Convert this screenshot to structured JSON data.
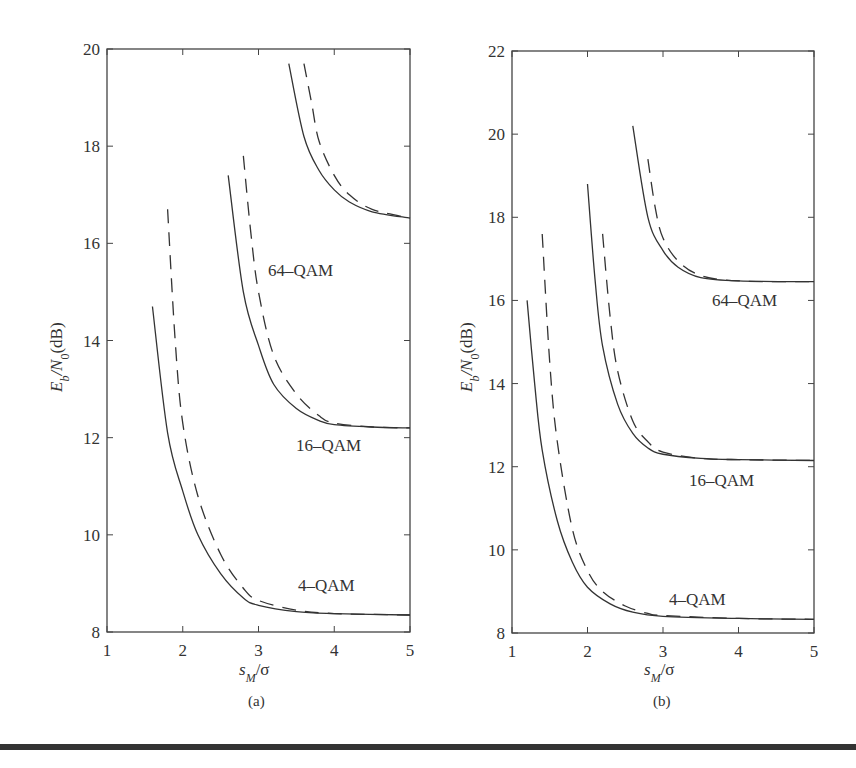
{
  "chart_data": [
    {
      "type": "line",
      "panel": "(a)",
      "xlabel": "s_M/σ",
      "ylabel": "E_b/N_0(dB)",
      "xlim": [
        1,
        5
      ],
      "ylim": [
        8,
        20
      ],
      "xticks": [
        1,
        2,
        3,
        4,
        5
      ],
      "yticks": [
        8,
        10,
        12,
        14,
        16,
        18,
        20
      ],
      "grid": false,
      "legend": "none (inline labels)",
      "annotations": [
        "64–QAM",
        "16–QAM",
        "4–QAM"
      ],
      "series": [
        {
          "name": "4-QAM solid",
          "style": "solid",
          "x": [
            1.6,
            1.8,
            2.0,
            2.2,
            2.5,
            2.8,
            3.0,
            3.5,
            4.0,
            5.0
          ],
          "y": [
            14.7,
            12.1,
            10.9,
            10.0,
            9.2,
            8.7,
            8.55,
            8.42,
            8.38,
            8.35
          ]
        },
        {
          "name": "4-QAM dashed",
          "style": "dashed",
          "x": [
            1.8,
            1.9,
            2.0,
            2.2,
            2.5,
            2.8,
            3.0,
            3.5,
            4.0,
            5.0
          ],
          "y": [
            16.7,
            14.0,
            12.3,
            10.8,
            9.6,
            8.9,
            8.65,
            8.45,
            8.38,
            8.35
          ]
        },
        {
          "name": "16-QAM solid",
          "style": "solid",
          "x": [
            2.6,
            2.8,
            3.0,
            3.2,
            3.5,
            3.8,
            4.0,
            4.5,
            5.0
          ],
          "y": [
            17.4,
            15.0,
            13.9,
            13.1,
            12.6,
            12.35,
            12.27,
            12.22,
            12.2
          ]
        },
        {
          "name": "16-QAM dashed",
          "style": "dashed",
          "x": [
            2.8,
            2.9,
            3.0,
            3.2,
            3.5,
            3.8,
            4.0,
            4.5,
            5.0
          ],
          "y": [
            17.8,
            16.2,
            15.0,
            13.7,
            12.9,
            12.45,
            12.3,
            12.22,
            12.2
          ]
        },
        {
          "name": "64-QAM solid",
          "style": "solid",
          "x": [
            3.4,
            3.6,
            3.8,
            4.0,
            4.2,
            4.5,
            5.0
          ],
          "y": [
            19.7,
            18.2,
            17.5,
            17.1,
            16.85,
            16.65,
            16.52
          ]
        },
        {
          "name": "64-QAM dashed",
          "style": "dashed",
          "x": [
            3.6,
            3.7,
            3.8,
            4.0,
            4.2,
            4.5,
            5.0
          ],
          "y": [
            19.7,
            18.9,
            18.1,
            17.4,
            17.0,
            16.7,
            16.52
          ]
        }
      ]
    },
    {
      "type": "line",
      "panel": "(b)",
      "xlabel": "s_M/σ",
      "ylabel": "E_b/N_0(dB)",
      "xlim": [
        1,
        5
      ],
      "ylim": [
        8,
        22
      ],
      "xticks": [
        1,
        2,
        3,
        4,
        5
      ],
      "yticks": [
        8,
        10,
        12,
        14,
        16,
        18,
        20,
        22
      ],
      "grid": false,
      "legend": "none (inline labels)",
      "annotations": [
        "64–QAM",
        "16–QAM",
        "4–QAM"
      ],
      "series": [
        {
          "name": "4-QAM solid",
          "style": "solid",
          "x": [
            1.2,
            1.3,
            1.4,
            1.6,
            1.8,
            2.0,
            2.3,
            2.6,
            3.0,
            4.0,
            5.0
          ],
          "y": [
            16.0,
            14.0,
            12.4,
            10.7,
            9.7,
            9.1,
            8.7,
            8.5,
            8.4,
            8.35,
            8.33
          ]
        },
        {
          "name": "4-QAM dashed",
          "style": "dashed",
          "x": [
            1.4,
            1.5,
            1.6,
            1.8,
            2.0,
            2.2,
            2.5,
            2.8,
            3.0,
            4.0,
            5.0
          ],
          "y": [
            17.6,
            14.5,
            12.6,
            10.5,
            9.5,
            9.0,
            8.65,
            8.47,
            8.42,
            8.35,
            8.33
          ]
        },
        {
          "name": "16-QAM solid",
          "style": "solid",
          "x": [
            2.0,
            2.1,
            2.2,
            2.4,
            2.6,
            2.8,
            3.0,
            3.5,
            4.0,
            5.0
          ],
          "y": [
            18.8,
            16.5,
            14.9,
            13.5,
            12.8,
            12.45,
            12.3,
            12.2,
            12.17,
            12.15
          ]
        },
        {
          "name": "16-QAM dashed",
          "style": "dashed",
          "x": [
            2.2,
            2.3,
            2.4,
            2.6,
            2.8,
            3.0,
            3.5,
            4.0,
            5.0
          ],
          "y": [
            17.6,
            15.6,
            14.3,
            13.1,
            12.6,
            12.35,
            12.2,
            12.17,
            12.15
          ]
        },
        {
          "name": "64-QAM solid",
          "style": "solid",
          "x": [
            2.6,
            2.8,
            3.0,
            3.2,
            3.5,
            4.0,
            5.0
          ],
          "y": [
            20.2,
            18.0,
            17.2,
            16.8,
            16.55,
            16.47,
            16.45
          ]
        },
        {
          "name": "64-QAM dashed",
          "style": "dashed",
          "x": [
            2.8,
            2.9,
            3.0,
            3.2,
            3.5,
            4.0,
            5.0
          ],
          "y": [
            19.4,
            18.2,
            17.5,
            16.95,
            16.6,
            16.47,
            16.45
          ]
        }
      ]
    }
  ],
  "panels": {
    "a": {
      "caption": "(a)",
      "xlabel_main": "s",
      "xlabel_sub": "M",
      "xlabel_rest": "/σ",
      "ylabel_E": "E",
      "ylabel_b": "b",
      "ylabel_mid": "/N",
      "ylabel_0": "0",
      "ylabel_rest": "(dB)",
      "labels": {
        "q64": "64–QAM",
        "q16": "16–QAM",
        "q4": "4–QAM"
      },
      "xticks": [
        "1",
        "2",
        "3",
        "4",
        "5"
      ],
      "yticks": [
        "8",
        "10",
        "12",
        "14",
        "16",
        "18",
        "20"
      ]
    },
    "b": {
      "caption": "(b)",
      "xlabel_main": "s",
      "xlabel_sub": "M",
      "xlabel_rest": "/σ",
      "ylabel_E": "E",
      "ylabel_b": "b",
      "ylabel_mid": "/N",
      "ylabel_0": "0",
      "ylabel_rest": "(dB)",
      "labels": {
        "q64": "64–QAM",
        "q16": "16–QAM",
        "q4": "4–QAM"
      },
      "xticks": [
        "1",
        "2",
        "3",
        "4",
        "5"
      ],
      "yticks": [
        "8",
        "10",
        "12",
        "14",
        "16",
        "18",
        "20",
        "22"
      ]
    }
  }
}
